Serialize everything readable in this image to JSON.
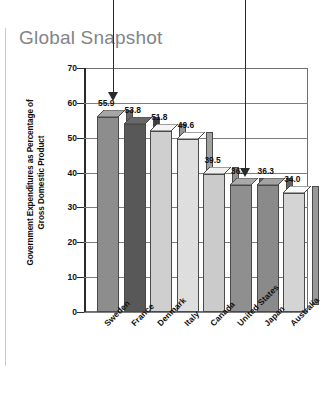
{
  "page": {
    "title": "Global Snapshot"
  },
  "chart_data": {
    "type": "bar",
    "title": "Global Snapshot",
    "xlabel": "",
    "ylabel": "Government Expenditures as Percentage of Gross Domestic Product",
    "ylim": [
      0,
      70
    ],
    "yticks": [
      "70",
      "60",
      "50",
      "40",
      "30",
      "20",
      "10",
      "0"
    ],
    "grid": true,
    "legend": "none",
    "categories": [
      "Sweden",
      "France",
      "Denmark",
      "Italy",
      "Canada",
      "United States",
      "Japan",
      "Australia"
    ],
    "values": [
      55.9,
      53.8,
      51.8,
      49.6,
      39.5,
      36.5,
      36.3,
      34.0
    ],
    "value_labels": [
      "55.9",
      "53.8",
      "51.8",
      "49.6",
      "39.5",
      "36.5",
      "36.3",
      "34.0"
    ],
    "bar_colors": [
      "#8d8d8d",
      "#585858",
      "#cfcfcf",
      "#dedede",
      "#cbcbcb",
      "#8f8f8f",
      "#8a8a8a",
      "#d4d4d4"
    ],
    "annotations": [
      {
        "label": "arrow-pointing-to-sweden",
        "target": "Sweden"
      },
      {
        "label": "arrow-pointing-to-united-states",
        "target": "United States"
      }
    ]
  }
}
